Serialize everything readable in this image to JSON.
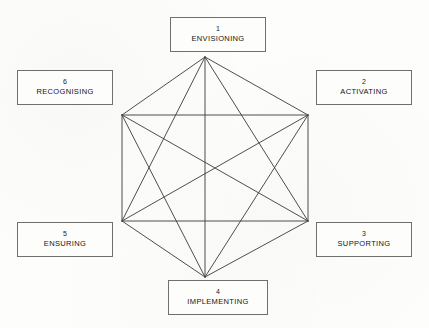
{
  "diagram": {
    "type": "hexagon-complete-graph",
    "background_color": "#fdfdfc",
    "line_color": "#3a3a3a",
    "box_border_color": "#6f6f6f",
    "center": {
      "x": 205,
      "y": 169
    },
    "vertices": [
      {
        "id": "v1",
        "position": "top",
        "x": 205,
        "y": 57
      },
      {
        "id": "v2",
        "position": "upper-right",
        "x": 308,
        "y": 115
      },
      {
        "id": "v3",
        "position": "lower-right",
        "x": 308,
        "y": 221
      },
      {
        "id": "v4",
        "position": "bottom",
        "x": 205,
        "y": 277
      },
      {
        "id": "v5",
        "position": "lower-left",
        "x": 122,
        "y": 221
      },
      {
        "id": "v6",
        "position": "upper-left",
        "x": 122,
        "y": 115
      }
    ],
    "edges": [
      [
        "v1",
        "v2"
      ],
      [
        "v1",
        "v3"
      ],
      [
        "v1",
        "v4"
      ],
      [
        "v1",
        "v5"
      ],
      [
        "v1",
        "v6"
      ],
      [
        "v2",
        "v3"
      ],
      [
        "v2",
        "v4"
      ],
      [
        "v2",
        "v5"
      ],
      [
        "v2",
        "v6"
      ],
      [
        "v3",
        "v4"
      ],
      [
        "v3",
        "v5"
      ],
      [
        "v3",
        "v6"
      ],
      [
        "v4",
        "v5"
      ],
      [
        "v4",
        "v6"
      ],
      [
        "v5",
        "v6"
      ]
    ],
    "nodes": [
      {
        "number": "1",
        "label": "ENVISIONING",
        "vertex": "v1",
        "box": {
          "left": 170,
          "top": 17,
          "width": 96,
          "height": 35
        }
      },
      {
        "number": "2",
        "label": "ACTIVATING",
        "vertex": "v2",
        "box": {
          "left": 316,
          "top": 70,
          "width": 96,
          "height": 35
        }
      },
      {
        "number": "3",
        "label": "SUPPORTING",
        "vertex": "v3",
        "box": {
          "left": 316,
          "top": 222,
          "width": 96,
          "height": 35
        }
      },
      {
        "number": "4",
        "label": "IMPLEMENTING",
        "vertex": "v4",
        "box": {
          "left": 168,
          "top": 280,
          "width": 100,
          "height": 35
        }
      },
      {
        "number": "5",
        "label": "ENSURING",
        "vertex": "v5",
        "box": {
          "left": 17,
          "top": 222,
          "width": 96,
          "height": 35
        }
      },
      {
        "number": "6",
        "label": "RECOGNISING",
        "vertex": "v6",
        "box": {
          "left": 17,
          "top": 70,
          "width": 96,
          "height": 35
        }
      }
    ]
  }
}
